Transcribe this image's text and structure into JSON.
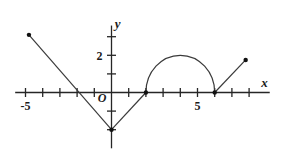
{
  "chart_data": {
    "type": "line",
    "title": "",
    "xlabel": "x",
    "ylabel": "y",
    "xlim": [
      -5.6,
      9.2
    ],
    "ylim": [
      -3.0,
      3.6
    ],
    "grid": false,
    "legend": null,
    "x_tick_labels": [
      {
        "value": -5,
        "text": "-5"
      },
      {
        "value": 5,
        "text": "5"
      }
    ],
    "y_tick_labels": [
      {
        "value": 2,
        "text": "2"
      }
    ],
    "origin_label": "O",
    "x_ticks": [
      -5,
      -4,
      -3,
      -2,
      -1,
      1,
      2,
      3,
      4,
      5,
      6,
      7,
      8
    ],
    "y_ticks": [
      -2,
      -1,
      1,
      2,
      3
    ],
    "series": [
      {
        "name": "left-descending-ray",
        "type": "line",
        "points": [
          [
            -4.8,
            3.1
          ],
          [
            0,
            -2
          ]
        ],
        "endpoint_dots": [
          [
            -4.8,
            3.1
          ]
        ]
      },
      {
        "name": "right-ascending-segment-of-v",
        "type": "line",
        "points": [
          [
            0,
            -2
          ],
          [
            2,
            0
          ]
        ],
        "endpoint_dots": [
          [
            0,
            -2
          ]
        ]
      },
      {
        "name": "semicircle",
        "type": "arc",
        "center": [
          4,
          0
        ],
        "radius": 2,
        "start_angle_deg": 0,
        "end_angle_deg": 180,
        "endpoint_dots": [
          [
            2,
            0
          ],
          [
            6,
            0
          ]
        ]
      },
      {
        "name": "right-rising-ray",
        "type": "line",
        "points": [
          [
            6,
            0
          ],
          [
            7.8,
            1.75
          ]
        ],
        "endpoint_dots": [
          [
            7.8,
            1.75
          ]
        ]
      }
    ],
    "x_intercepts": [
      -2,
      2,
      6
    ],
    "annotations": [
      {
        "text": "x",
        "at": [
          8.9,
          0.28
        ],
        "style": "axis-label"
      },
      {
        "text": "y",
        "at": [
          0.35,
          3.45
        ],
        "style": "axis-label"
      },
      {
        "text": "O",
        "at": [
          -0.55,
          -0.52
        ],
        "style": "origin-label"
      }
    ],
    "colors": {
      "axis": "#262626",
      "curve": "#3a3a3a",
      "dot": "#111111",
      "background": "#ffffff"
    }
  },
  "figure": {
    "caption": ""
  }
}
